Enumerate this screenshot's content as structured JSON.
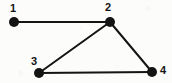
{
  "figure": {
    "kind": "undirected-graph-diagram",
    "width": 172,
    "height": 83,
    "background_color": "#fcfcfb",
    "ink_color": "#141414"
  },
  "chart_data": {
    "type": "diagram",
    "title": "",
    "xlabel": "",
    "ylabel": "",
    "graph_type": "undirected graph",
    "node_count": 4,
    "edge_count": 4,
    "nodes": [
      {
        "id": "1",
        "label": "1",
        "x": 14,
        "y": 22,
        "radius": 5,
        "label_x": 10,
        "label_y": 3,
        "label_position": "above-left"
      },
      {
        "id": "2",
        "label": "2",
        "x": 110,
        "y": 22,
        "radius": 5,
        "label_x": 105,
        "label_y": 2,
        "label_position": "above-left"
      },
      {
        "id": "3",
        "label": "3",
        "x": 39,
        "y": 73,
        "radius": 5,
        "label_x": 31,
        "label_y": 56,
        "label_position": "above-left"
      },
      {
        "id": "4",
        "label": "4",
        "x": 152,
        "y": 72,
        "radius": 5,
        "label_x": 160,
        "label_y": 65,
        "label_position": "right"
      }
    ],
    "edges": [
      {
        "source": "1",
        "target": "2",
        "orientation": "horizontal"
      },
      {
        "source": "2",
        "target": "3",
        "orientation": "diagonal"
      },
      {
        "source": "2",
        "target": "4",
        "orientation": "diagonal"
      },
      {
        "source": "3",
        "target": "4",
        "orientation": "horizontal"
      }
    ],
    "edge_width": 2,
    "node_fill": "#141414",
    "edge_color": "#141414"
  }
}
